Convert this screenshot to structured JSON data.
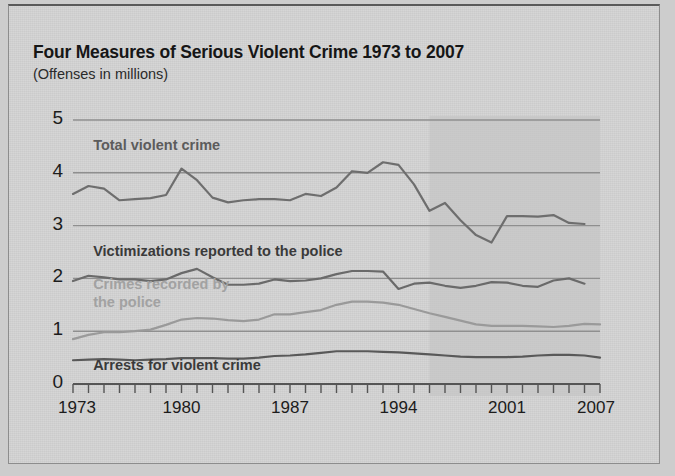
{
  "header": {
    "title": "Four Measures of Serious Violent Crime 1973 to 2007",
    "subtitle": "(Offenses in millions)"
  },
  "chart_data": {
    "type": "line",
    "title": "Four Measures of Serious Violent Crime 1973 to 2007",
    "subtitle": "(Offenses in millions)",
    "xlabel": "",
    "ylabel": "Offenses in millions",
    "xlim": [
      1973,
      2007
    ],
    "ylim": [
      0,
      5
    ],
    "yticks": [
      0,
      1,
      2,
      3,
      4,
      5
    ],
    "ytick_labels": [
      "0",
      "1",
      "2",
      "3",
      "4",
      "5"
    ],
    "xticks": [
      1973,
      1980,
      1987,
      1994,
      2001,
      2007
    ],
    "xtick_labels": [
      "1973",
      "1980",
      "1987",
      "1994",
      "2001",
      "2007"
    ],
    "minor_xticks_every": 1,
    "grid": "horizontal",
    "legend_position": "inline-annotations",
    "shaded_region": {
      "x_start": 1996,
      "x_end": 2007,
      "color": "#c3c3c3",
      "note": "light gray band over later years"
    },
    "colors": {
      "total_violent_crime": "#6e6e6e",
      "victimizations_reported": "#6a6a6a",
      "crimes_recorded": "#9a9a9a",
      "arrests": "#595959",
      "gridline": "#8f8f8f",
      "axis": "#555555",
      "label_dark": "#5c5c5c",
      "label_light": "#a2a2a2"
    },
    "x": [
      1973,
      1974,
      1975,
      1976,
      1977,
      1978,
      1979,
      1980,
      1981,
      1982,
      1983,
      1984,
      1985,
      1986,
      1987,
      1988,
      1989,
      1990,
      1991,
      1992,
      1993,
      1994,
      1995,
      1996,
      1997,
      1998,
      1999,
      2000,
      2001,
      2002,
      2003,
      2004,
      2005,
      2006,
      2007
    ],
    "series": [
      {
        "name": "Total violent crime",
        "label": "Total violent crime",
        "color": "#6e6e6e",
        "label_color": "#5c5c5c",
        "label_x": 1974.3,
        "label_y": 4.48,
        "values": [
          3.6,
          3.75,
          3.7,
          3.48,
          3.5,
          3.52,
          3.58,
          4.08,
          3.86,
          3.53,
          3.44,
          3.48,
          3.5,
          3.5,
          3.48,
          3.6,
          3.56,
          3.72,
          4.03,
          4.0,
          4.2,
          4.15,
          3.78,
          3.28,
          3.43,
          3.1,
          2.82,
          2.68,
          3.18,
          3.18,
          3.17,
          3.2,
          3.05,
          3.03,
          3.15
        ],
        "x_end": 2006
      },
      {
        "name": "Victimizations reported to the police",
        "label": "Victimizations reported to the police",
        "color": "#6a6a6a",
        "label_color": "#3a3a3a",
        "label_x": 1974.3,
        "label_y": 2.48,
        "values": [
          1.95,
          2.05,
          2.02,
          1.98,
          1.98,
          1.95,
          1.98,
          2.1,
          2.18,
          2.02,
          1.88,
          1.88,
          1.9,
          1.98,
          1.95,
          1.96,
          2.0,
          2.08,
          2.14,
          2.14,
          2.13,
          1.8,
          1.9,
          1.92,
          1.86,
          1.82,
          1.86,
          1.93,
          1.92,
          1.86,
          1.84,
          1.96,
          2.0,
          1.9,
          1.95
        ],
        "x_end": 2006
      },
      {
        "name": "Crimes recorded by the police",
        "label": "Crimes recorded by\nthe police",
        "label_line1": "Crimes recorded by",
        "label_line2": "the police",
        "color": "#9a9a9a",
        "label_color": "#a2a2a2",
        "label_x": 1974.3,
        "label_y": 1.86,
        "values": [
          0.85,
          0.93,
          0.98,
          0.98,
          1.0,
          1.03,
          1.12,
          1.22,
          1.25,
          1.24,
          1.21,
          1.19,
          1.22,
          1.32,
          1.32,
          1.36,
          1.4,
          1.5,
          1.56,
          1.56,
          1.54,
          1.5,
          1.42,
          1.34,
          1.27,
          1.2,
          1.13,
          1.1,
          1.1,
          1.1,
          1.09,
          1.08,
          1.1,
          1.14,
          1.13
        ],
        "x_end": 2007
      },
      {
        "name": "Arrests for violent crime",
        "label": "Arrests for violent crime",
        "color": "#595959",
        "label_color": "#3a3a3a",
        "label_x": 1974.3,
        "label_y": 0.33,
        "values": [
          0.45,
          0.46,
          0.47,
          0.46,
          0.45,
          0.46,
          0.47,
          0.49,
          0.49,
          0.49,
          0.48,
          0.48,
          0.5,
          0.53,
          0.54,
          0.56,
          0.59,
          0.62,
          0.62,
          0.62,
          0.61,
          0.6,
          0.58,
          0.56,
          0.54,
          0.52,
          0.51,
          0.51,
          0.51,
          0.52,
          0.54,
          0.55,
          0.55,
          0.54,
          0.5
        ],
        "x_end": 2007
      }
    ]
  }
}
